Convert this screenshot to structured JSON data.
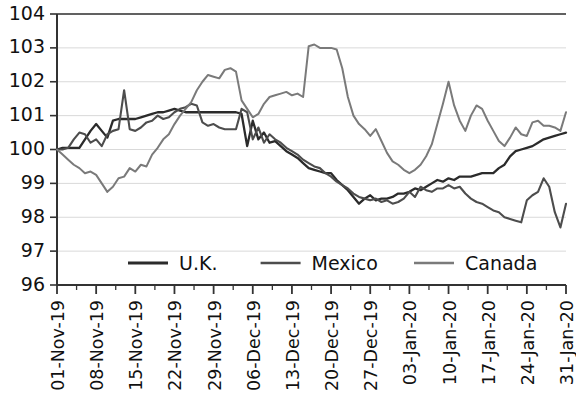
{
  "chart_data": {
    "type": "line",
    "title": "",
    "subtitle": "",
    "xlabel": "",
    "ylabel": "",
    "ylim": [
      96,
      104
    ],
    "ytick_labels": [
      "104",
      "103",
      "102",
      "101",
      "100",
      "99",
      "98",
      "97",
      "96"
    ],
    "ytick_values": [
      104,
      103,
      102,
      101,
      100,
      99,
      98,
      97,
      96
    ],
    "grid": true,
    "grid_axis": "y",
    "legend_position": "inside-bottom-center",
    "x_tick_interval_days": 7,
    "xtick_labels": [
      "01-Nov-19",
      "08-Nov-19",
      "15-Nov-19",
      "22-Nov-19",
      "29-Nov-19",
      "06-Dec-19",
      "13-Dec-19",
      "20-Dec-19",
      "27-Dec-19",
      "03-Jan-20",
      "10-Jan-20",
      "17-Jan-20",
      "24-Jan-20",
      "31-Jan-20"
    ],
    "x_start": "01-Nov-19",
    "x_end": "31-Jan-20",
    "n_points": 92,
    "series": [
      {
        "name": "U.K.",
        "color": "#2b2b2b",
        "values": [
          100.0,
          100.05,
          100.05,
          100.05,
          100.05,
          100.3,
          100.55,
          100.75,
          100.55,
          100.35,
          100.85,
          100.9,
          100.9,
          100.9,
          100.9,
          100.95,
          101.0,
          101.05,
          101.1,
          101.1,
          101.15,
          101.2,
          101.15,
          101.1,
          101.1,
          101.1,
          101.1,
          101.1,
          101.1,
          101.1,
          101.1,
          101.1,
          101.1,
          101.05,
          100.1,
          100.85,
          100.3,
          100.5,
          100.2,
          100.25,
          100.1,
          99.95,
          99.85,
          99.75,
          99.6,
          99.45,
          99.4,
          99.35,
          99.3,
          99.3,
          99.1,
          98.95,
          98.8,
          98.6,
          98.4,
          98.55,
          98.65,
          98.5,
          98.55,
          98.55,
          98.6,
          98.7,
          98.7,
          98.75,
          98.85,
          98.8,
          98.9,
          99.0,
          99.1,
          99.05,
          99.15,
          99.1,
          99.2,
          99.2,
          99.2,
          99.25,
          99.3,
          99.3,
          99.3,
          99.45,
          99.55,
          99.8,
          99.95,
          100.0,
          100.05,
          100.1,
          100.2,
          100.3,
          100.35,
          100.4,
          100.45,
          100.5
        ]
      },
      {
        "name": "Mexico",
        "color": "#4d4d4d",
        "values": [
          100.0,
          100.0,
          100.05,
          100.3,
          100.5,
          100.45,
          100.2,
          100.3,
          100.1,
          100.45,
          100.55,
          100.6,
          101.75,
          100.6,
          100.55,
          100.65,
          100.8,
          100.85,
          101.0,
          100.9,
          100.95,
          101.1,
          101.2,
          101.25,
          101.35,
          101.3,
          100.8,
          100.7,
          100.75,
          100.65,
          100.6,
          100.6,
          100.6,
          101.2,
          101.1,
          100.3,
          100.65,
          100.2,
          100.45,
          100.3,
          100.2,
          100.05,
          99.95,
          99.85,
          99.7,
          99.6,
          99.5,
          99.45,
          99.3,
          99.2,
          99.05,
          98.95,
          98.85,
          98.7,
          98.6,
          98.55,
          98.5,
          98.55,
          98.45,
          98.5,
          98.4,
          98.45,
          98.55,
          98.75,
          98.6,
          98.9,
          98.8,
          98.75,
          98.85,
          98.85,
          98.95,
          98.85,
          98.9,
          98.7,
          98.55,
          98.45,
          98.4,
          98.3,
          98.2,
          98.15,
          98.0,
          97.95,
          97.9,
          97.85,
          98.5,
          98.65,
          98.75,
          99.15,
          98.9,
          98.15,
          97.7,
          98.4
        ]
      },
      {
        "name": "Canada",
        "color": "#7a7a7a",
        "values": [
          100.0,
          99.85,
          99.7,
          99.55,
          99.45,
          99.3,
          99.35,
          99.25,
          99.0,
          98.75,
          98.9,
          99.15,
          99.2,
          99.45,
          99.35,
          99.55,
          99.5,
          99.85,
          100.05,
          100.3,
          100.45,
          100.75,
          101.0,
          101.2,
          101.4,
          101.75,
          102.0,
          102.2,
          102.15,
          102.1,
          102.35,
          102.4,
          102.3,
          101.45,
          101.2,
          100.95,
          101.05,
          101.35,
          101.55,
          101.6,
          101.65,
          101.7,
          101.6,
          101.65,
          101.55,
          103.05,
          103.1,
          103.0,
          103.0,
          103.0,
          102.95,
          102.4,
          101.55,
          101.0,
          100.75,
          100.6,
          100.4,
          100.6,
          100.25,
          99.9,
          99.65,
          99.55,
          99.4,
          99.3,
          99.4,
          99.55,
          99.8,
          100.15,
          100.75,
          101.35,
          102.0,
          101.3,
          100.85,
          100.55,
          101.0,
          101.3,
          101.2,
          100.85,
          100.55,
          100.25,
          100.1,
          100.35,
          100.65,
          100.45,
          100.4,
          100.8,
          100.85,
          100.7,
          100.7,
          100.65,
          100.55,
          101.1
        ]
      }
    ],
    "legend": [
      {
        "label": "U.K.",
        "color": "#2b2b2b"
      },
      {
        "label": "Mexico",
        "color": "#4d4d4d"
      },
      {
        "label": "Canada",
        "color": "#7a7a7a"
      }
    ]
  },
  "axes": {
    "axis_color": "#333333",
    "grid_color": "#d9d9d9",
    "background": "#ffffff"
  }
}
